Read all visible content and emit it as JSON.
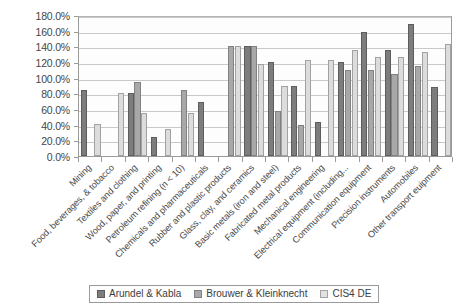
{
  "chart_data": {
    "type": "bar",
    "title": "",
    "subtitle": "",
    "xlabel": "",
    "ylabel": "",
    "ylim": [
      0,
      180
    ],
    "ytick_labels": [
      "0.0%",
      "20.0%",
      "40.0%",
      "60.0%",
      "80.0%",
      "100.0%",
      "120.0%",
      "140.0%",
      "160.0%",
      "180.0%"
    ],
    "ytick_values": [
      0,
      20,
      40,
      60,
      80,
      100,
      120,
      140,
      160,
      180
    ],
    "grid": true,
    "legend_position": "bottom",
    "categories": [
      "Mining",
      "Food, beverages, & tobacco",
      "Textiles and clothing",
      "Wood, paper, and printing",
      "Petroleum refining (n < 10)",
      "Chemicals and pharmaceuticals",
      "Rubber and plastic products",
      "Glass, clay, and ceramics",
      "Basic metals (iron and steel)",
      "Fabricated metal products",
      "Mechanical engineering",
      "Electrical equipment (including...",
      "Communication equipment",
      "Precision instruments",
      "Automobiles",
      "Other transport euipment"
    ],
    "series": [
      {
        "name": "Arundel & Kabla",
        "color": "#7d7d7d",
        "values": [
          84,
          null,
          80,
          24,
          null,
          69,
          null,
          140,
          120,
          90,
          44,
          120,
          158,
          135,
          168,
          88
        ]
      },
      {
        "name": "Brouwer & Kleinknecht",
        "color": "#a8a8a8",
        "values": [
          null,
          null,
          95,
          null,
          84,
          null,
          140,
          140,
          57,
          40,
          null,
          110,
          110,
          105,
          115,
          null
        ]
      },
      {
        "name": "CIS4 DE",
        "color": "#dcdcdc",
        "values": [
          41,
          80,
          55,
          34,
          55,
          null,
          140,
          118,
          90,
          122,
          122,
          135,
          127,
          127,
          133,
          143
        ]
      }
    ]
  },
  "legend": {
    "items": [
      {
        "label": "Arundel & Kabla"
      },
      {
        "label": "Brouwer & Kleinknecht"
      },
      {
        "label": "CIS4 DE"
      }
    ]
  },
  "colors": {
    "series_1": "#7d7d7d",
    "series_2": "#a8a8a8",
    "series_3": "#dcdcdc",
    "gridline": "#c9c9c9",
    "axis": "#9a9a9a",
    "background": "#ffffff"
  }
}
